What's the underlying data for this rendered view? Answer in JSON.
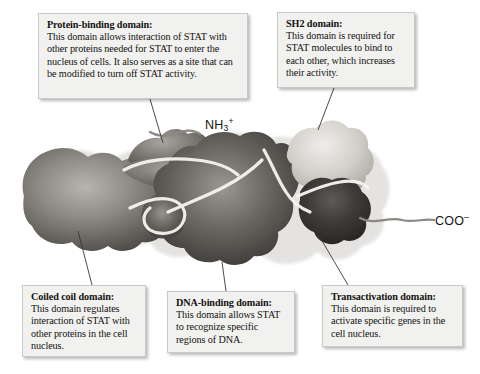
{
  "figure": {
    "termini": {
      "n_terminus": "NH",
      "n_terminus_sub": "3",
      "n_terminus_sup": "+",
      "c_terminus": "COO",
      "c_terminus_sup": "–"
    },
    "colors": {
      "background": "#ffffff",
      "callout_fill": "#f1f1f0",
      "callout_border": "#c9c9c7",
      "text": "#14120f",
      "leader_line": "#3a3733",
      "protein_dark": "#4a4744",
      "protein_mid": "#8e8b86",
      "protein_light": "#d8d5d0",
      "protein_darkest": "#2f2d2b",
      "domain_divider": "#f6f4f0"
    }
  },
  "callouts": [
    {
      "id": "protein-binding",
      "title": "Protein-binding domain:",
      "body": "This domain allows interaction of STAT with other proteins needed for STAT to enter the nucleus of cells. It also serves as a site that can be modified to turn off STAT activity."
    },
    {
      "id": "sh2",
      "title": "SH2 domain:",
      "body": "This domain is required for STAT molecules to bind to each other, which increases their activity."
    },
    {
      "id": "coiled-coil",
      "title": "Coiled coil domain:",
      "body": "This domain regulates interaction of STAT with other proteins in the cell nucleus."
    },
    {
      "id": "dna-binding",
      "title": "DNA-binding domain:",
      "body": "This domain allows STAT to recognize specific regions of DNA."
    },
    {
      "id": "transactivation",
      "title": "Transactivation domain:",
      "body": "This domain is required to activate specific genes in the cell nucleus."
    }
  ]
}
